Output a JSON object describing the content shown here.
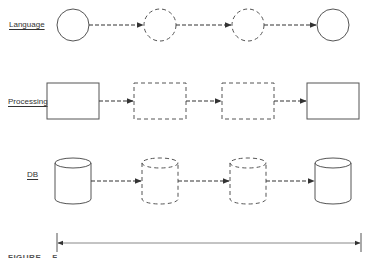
{
  "rows": [
    {
      "label": "Language",
      "shape": "circle",
      "nodes": [
        "solid",
        "dashed",
        "dashed",
        "solid"
      ]
    },
    {
      "label": "Processing",
      "shape": "rect",
      "nodes": [
        "solid",
        "dashed",
        "dashed",
        "solid"
      ]
    },
    {
      "label": "DB",
      "shape": "cylinder",
      "nodes": [
        "solid",
        "dashed",
        "dashed",
        "solid"
      ]
    }
  ],
  "timeline": {
    "type": "double-arrow"
  },
  "caption": {
    "prefix": "FIGURE",
    "text": "F"
  },
  "colors": {
    "stroke": "#555555",
    "arrow": "#333333"
  }
}
